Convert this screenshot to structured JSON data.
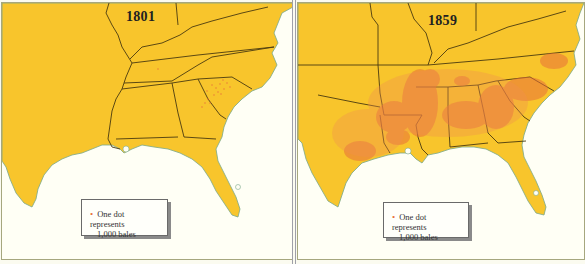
{
  "maps": [
    {
      "year": "1801",
      "legend": {
        "symbol": "•",
        "line1": "One dot represents",
        "line2": "1,000 bales"
      },
      "density": "sparse, concentrated in South Carolina and eastern Georgia"
    },
    {
      "year": "1859",
      "legend": {
        "symbol": "•",
        "line1": "One dot represents",
        "line2": "1,000 bales"
      },
      "density": "dense across Mississippi, Alabama, Georgia, South Carolina, Louisiana, Arkansas, east Texas, west Tennessee and North Carolina"
    }
  ],
  "colors": {
    "land": "#f8c52c",
    "water": "#fffff5",
    "border": "#4a3a10",
    "dot": "#e8703a",
    "coast": "#7aa88a"
  }
}
